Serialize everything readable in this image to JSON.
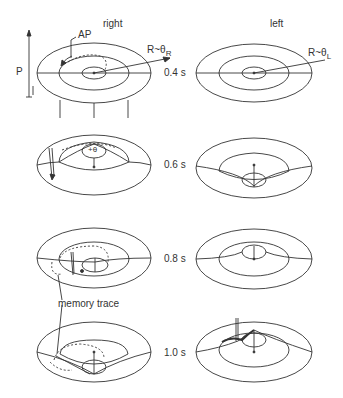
{
  "columns": {
    "right": "right",
    "left": "left"
  },
  "labels": {
    "ap": "AP",
    "p": "P",
    "r_right": "R~θ",
    "r_right_sub": "R",
    "r_left": "R~θ",
    "r_left_sub": "L",
    "theta_plus": "+θ",
    "memory_trace": "memory trace"
  },
  "rows": [
    {
      "time": "0.4 s"
    },
    {
      "time": "0.6 s"
    },
    {
      "time": "0.8 s"
    },
    {
      "time": "1.0 s"
    }
  ],
  "colors": {
    "line": "#333333",
    "background": "#ffffff"
  }
}
